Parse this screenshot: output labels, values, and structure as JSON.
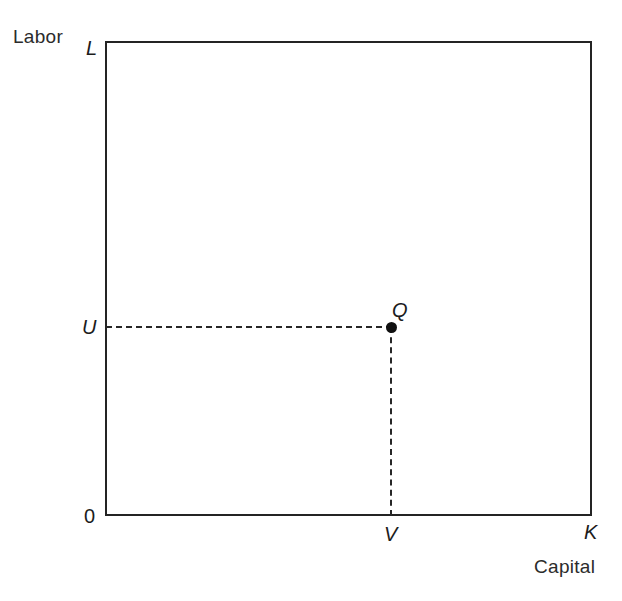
{
  "figure": {
    "type": "economics-isoquant-input-space-diagram",
    "background_color": "#ffffff",
    "line_color": "#242424"
  },
  "axes": {
    "y_axis_name": "Labor",
    "y_axis_endpoint_label": "L",
    "x_axis_name": "Capital",
    "x_axis_endpoint_label": "K",
    "origin_label": "0"
  },
  "annotations": {
    "point_label": "Q",
    "labor_level_label": "U",
    "capital_level_label": "V"
  },
  "chart_data": {
    "type": "scatter",
    "title": "",
    "xlabel": "Capital",
    "ylabel": "Labor",
    "xlim": [
      0,
      1
    ],
    "ylim": [
      0,
      1
    ],
    "grid": false,
    "legend": null,
    "x_tick_labels": [
      "0",
      "V",
      "K"
    ],
    "y_tick_labels": [
      "0",
      "U",
      "L"
    ],
    "points": [
      {
        "name": "Q",
        "x": 0.586,
        "y": 0.398,
        "marker": "filled-circle",
        "color": "#111111",
        "label": "Q",
        "label_position": "upper-right"
      }
    ],
    "guide_lines": [
      {
        "name": "labor-guide",
        "orientation": "horizontal",
        "style": "dashed",
        "from": {
          "x": 0.0,
          "y": 0.398
        },
        "to": {
          "x": 0.586,
          "y": 0.398
        },
        "value_label": "U"
      },
      {
        "name": "capital-guide",
        "orientation": "vertical",
        "style": "dashed",
        "from": {
          "x": 0.586,
          "y": 0.398
        },
        "to": {
          "x": 0.586,
          "y": 0.0
        },
        "value_label": "V"
      }
    ],
    "annotations": [
      {
        "text": "Labor",
        "position": "above-y-axis-top-left"
      },
      {
        "text": "Capital",
        "position": "below-x-axis-right"
      },
      {
        "text": "L",
        "position": "y-axis-top"
      },
      {
        "text": "K",
        "position": "x-axis-right"
      },
      {
        "text": "0",
        "position": "origin"
      }
    ]
  }
}
